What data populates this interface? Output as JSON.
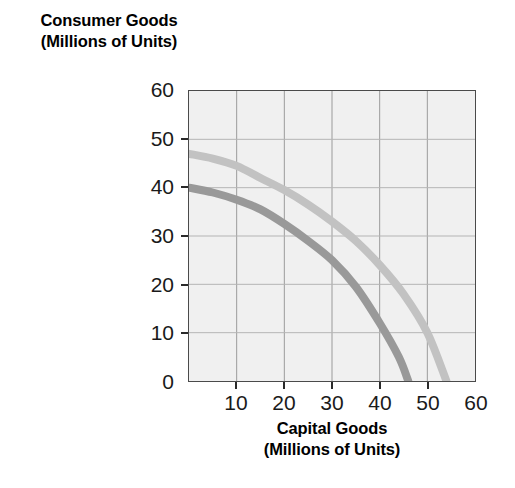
{
  "chart_data": {
    "type": "line",
    "title": "",
    "xlabel": "Capital Goods (Millions of Units)",
    "ylabel": "Consumer Goods (Millions of Units)",
    "xlabel_line1": "Capital Goods",
    "xlabel_line2": "(Millions of Units)",
    "ylabel_line1": "Consumer Goods",
    "ylabel_line2": "(Millions of Units)",
    "xlim": [
      0,
      60
    ],
    "ylim": [
      0,
      60
    ],
    "xticks": [
      0,
      10,
      20,
      30,
      40,
      50,
      60
    ],
    "yticks": [
      0,
      10,
      20,
      30,
      40,
      50,
      60
    ],
    "xtick_labels": [
      "",
      "10",
      "20",
      "30",
      "40",
      "50",
      "60"
    ],
    "ytick_labels": [
      "0",
      "10",
      "20",
      "30",
      "40",
      "50",
      "60"
    ],
    "grid": true,
    "legend": "none",
    "plot_background": "#f0f0f0",
    "series": [
      {
        "name": "outer-ppf-curve",
        "color": "#c2c2c2",
        "linewidth": 8,
        "x": [
          0,
          5,
          10,
          15,
          20,
          25,
          30,
          35,
          40,
          45,
          50,
          54
        ],
        "y": [
          47,
          46,
          44.5,
          42,
          39.5,
          36.5,
          33,
          29,
          24,
          18,
          10,
          0
        ]
      },
      {
        "name": "inner-ppf-curve",
        "color": "#999999",
        "linewidth": 8,
        "x": [
          0,
          5,
          10,
          15,
          20,
          25,
          30,
          35,
          40,
          44,
          46
        ],
        "y": [
          40,
          39,
          37.5,
          35.5,
          32.5,
          29,
          25,
          19.5,
          12,
          5,
          0
        ]
      }
    ]
  },
  "axes": {
    "y_title_line1": "Consumer Goods",
    "y_title_line2": "(Millions of Units)",
    "x_title_line1": "Capital Goods",
    "x_title_line2": "(Millions of Units)"
  }
}
